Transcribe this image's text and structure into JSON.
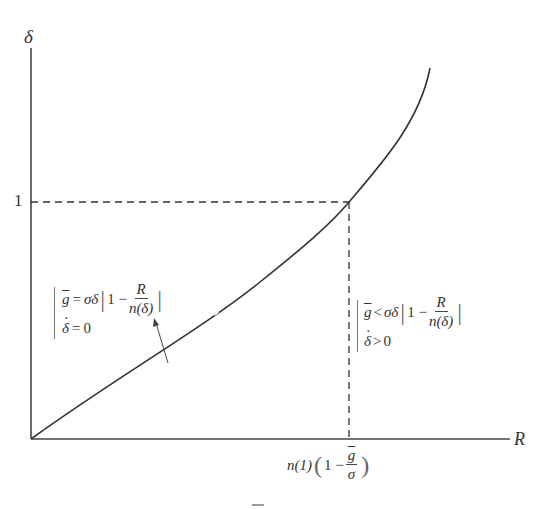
{
  "figure": {
    "y_axis_label": "δ",
    "x_axis_label": "R",
    "y_tick_label": "1",
    "x_tick_label": {
      "prefix": "n(1)",
      "open_paren": "(",
      "one_minus": "1 −",
      "frac_num": "g",
      "frac_den": "σ",
      "close_paren": ")"
    },
    "left_region": {
      "line1": {
        "lhs": "g",
        "op": "=",
        "rhs": "σδ",
        "one_minus": "1 −",
        "frac_num": "R",
        "frac_den": "n(δ)"
      },
      "line2": {
        "lhs": "δ",
        "op": "=",
        "rhs": "0"
      }
    },
    "right_region": {
      "line1": {
        "lhs": "g",
        "op": "<",
        "rhs": "σδ",
        "one_minus": "1 −",
        "frac_num": "R",
        "frac_den": "n(δ)"
      },
      "line2": {
        "lhs": "δ",
        "op": ">",
        "rhs": "0"
      }
    },
    "caption": "—",
    "colors": {
      "line": "#333333",
      "dashed": "#333333",
      "background": "#ffffff"
    }
  }
}
